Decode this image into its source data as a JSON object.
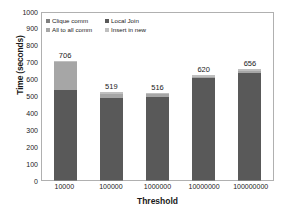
{
  "chart_data": {
    "type": "bar",
    "stacked": true,
    "title": "",
    "xlabel": "Threshold",
    "ylabel": "Time (seconds)",
    "categories": [
      "10000",
      "100000",
      "1000000",
      "10000000",
      "100000000"
    ],
    "ylim": [
      0,
      1000
    ],
    "yticks": [
      1000,
      900,
      800,
      700,
      600,
      500,
      400,
      300,
      200,
      100,
      0
    ],
    "grid": false,
    "legend_position": "top-left-inside",
    "series": [
      {
        "name": "Clique comm",
        "color": "#7f7f7f",
        "values": [
          3,
          2,
          2,
          2,
          2
        ]
      },
      {
        "name": "Local Join",
        "color": "#595959",
        "values": [
          528,
          486,
          488,
          600,
          633
        ]
      },
      {
        "name": "All to all comm",
        "color": "#a6a6a6",
        "values": [
          168,
          22,
          17,
          9,
          12
        ]
      },
      {
        "name": "Insert in new",
        "color": "#bfbfbf",
        "values": [
          7,
          9,
          9,
          9,
          9
        ]
      }
    ],
    "totals": [
      706,
      519,
      516,
      620,
      656
    ],
    "value_labels": [
      "706",
      "519",
      "516",
      "620",
      "656"
    ]
  },
  "colors": {
    "frame": "#b0b0b0",
    "background": "#ffffff",
    "text": "#1a1a1a"
  }
}
